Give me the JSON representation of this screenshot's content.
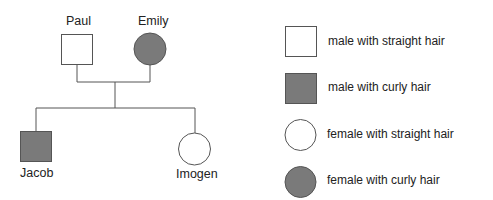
{
  "colors": {
    "affected_fill": "#7a7a7a",
    "unaffected_fill": "#ffffff",
    "stroke": "#555555"
  },
  "pedigree": {
    "parents": [
      {
        "name": "Paul",
        "sex": "male",
        "trait": "straight hair"
      },
      {
        "name": "Emily",
        "sex": "female",
        "trait": "curly hair"
      }
    ],
    "children": [
      {
        "name": "Jacob",
        "sex": "male",
        "trait": "curly hair"
      },
      {
        "name": "Imogen",
        "sex": "female",
        "trait": "straight hair"
      }
    ]
  },
  "legend": [
    {
      "symbol": "square-white",
      "label": "male with straight hair"
    },
    {
      "symbol": "square-shaded",
      "label": "male with curly hair"
    },
    {
      "symbol": "circle-white",
      "label": "female with straight hair"
    },
    {
      "symbol": "circle-shaded",
      "label": "female with curly hair"
    }
  ]
}
